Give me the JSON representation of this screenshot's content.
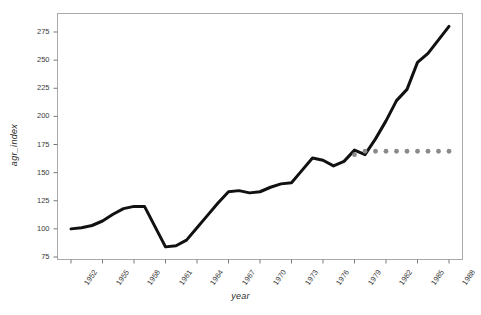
{
  "chart_data": {
    "type": "line",
    "title": "",
    "xlabel": "year",
    "ylabel": "agr_index",
    "xlim": [
      1952,
      1988
    ],
    "ylim": [
      75,
      282
    ],
    "grid": false,
    "legend": "none",
    "xticks": [
      "1952",
      "1955",
      "1958",
      "1961",
      "1964",
      "1967",
      "1970",
      "1973",
      "1976",
      "1979",
      "1982",
      "1985",
      "1988"
    ],
    "xtick_values": [
      1952,
      1955,
      1958,
      1961,
      1964,
      1967,
      1970,
      1973,
      1976,
      1979,
      1982,
      1985,
      1988
    ],
    "yticks": [
      "75",
      "100",
      "125",
      "150",
      "175",
      "200",
      "225",
      "250",
      "275"
    ],
    "ytick_values": [
      75,
      100,
      125,
      150,
      175,
      200,
      225,
      250,
      275
    ],
    "x": [
      1952,
      1953,
      1954,
      1955,
      1956,
      1957,
      1958,
      1959,
      1960,
      1961,
      1962,
      1963,
      1964,
      1965,
      1966,
      1967,
      1968,
      1969,
      1970,
      1971,
      1972,
      1973,
      1974,
      1975,
      1976,
      1977,
      1978,
      1979,
      1980,
      1981,
      1982,
      1983,
      1984,
      1985,
      1986,
      1987,
      1988
    ],
    "series": [
      {
        "name": "agr_index",
        "type": "line",
        "color": "#111111",
        "style": "solid",
        "width": 3,
        "values": [
          100,
          101,
          103,
          107,
          113,
          118,
          120,
          120,
          102,
          84,
          85,
          90,
          101,
          112,
          123,
          133,
          134,
          132,
          133,
          137,
          140,
          141,
          152,
          163,
          161,
          156,
          160,
          170,
          166,
          180,
          196,
          214,
          224,
          248,
          256,
          268,
          280
        ]
      },
      {
        "name": "reference",
        "type": "scatter",
        "color": "#8a8a8a",
        "style": "dotted",
        "marker": "circle",
        "marker_size": 4,
        "x": [
          1979,
          1980,
          1981,
          1982,
          1983,
          1984,
          1985,
          1986,
          1987,
          1988
        ],
        "values": [
          166,
          169,
          169,
          169,
          169,
          169,
          169,
          169,
          169,
          169
        ]
      }
    ],
    "colors": {
      "line": "#111111",
      "dots": "#8a8a8a",
      "frame": "#aaaaaa",
      "text": "#3a3a3a",
      "background": "#ffffff"
    }
  }
}
